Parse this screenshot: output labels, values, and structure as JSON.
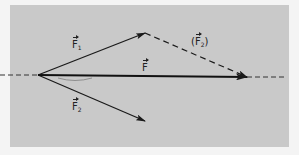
{
  "diagram": {
    "type": "vector-addition",
    "background_color": "#c9c9c9",
    "line_color": "#1a1a1a",
    "origin": {
      "x": 38,
      "y": 75
    },
    "vectors": [
      {
        "id": "F1",
        "symbol": "F",
        "subscript": "1",
        "label_text": "F₁",
        "tip": {
          "x": 145,
          "y": 33
        },
        "style": "solid"
      },
      {
        "id": "F",
        "symbol": "F",
        "subscript": "",
        "label_text": "F",
        "tip": {
          "x": 247,
          "y": 77
        },
        "style": "solid-bold"
      },
      {
        "id": "F2",
        "symbol": "F",
        "subscript": "2",
        "label_text": "F₂",
        "tip": {
          "x": 145,
          "y": 121
        },
        "style": "solid"
      }
    ],
    "translated_vector": {
      "id": "F2-translated",
      "symbol": "F",
      "subscript": "2",
      "label_text": "(F₂)",
      "open_paren": "(",
      "close_paren": ")",
      "from": {
        "x": 145,
        "y": 33
      },
      "to": {
        "x": 247,
        "y": 77
      },
      "style": "dashed"
    },
    "axis": {
      "style": "dashed",
      "left_segment": [
        0,
        38
      ],
      "right_segment": [
        247,
        286
      ],
      "y": 76
    }
  }
}
